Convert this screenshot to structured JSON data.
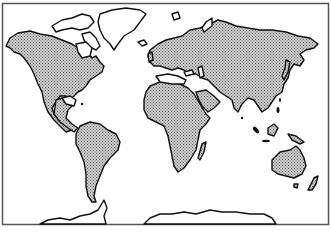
{
  "map": {
    "type": "world-outline-map",
    "projection": "miller-like cylindrical",
    "style": {
      "land_fill": "stippled-gray",
      "land_base_color": "#c8c8c8",
      "dot_color": "#6a6a6a",
      "coastline_color": "#111111",
      "ocean_color": "#ffffff",
      "frame_color": "#555555"
    },
    "regions": [
      {
        "name": "North America",
        "filled": true
      },
      {
        "name": "Greenland",
        "filled": false
      },
      {
        "name": "Canadian Arctic Archipelago",
        "filled": false
      },
      {
        "name": "South America",
        "filled": true
      },
      {
        "name": "Europe",
        "filled": true
      },
      {
        "name": "Asia",
        "filled": true
      },
      {
        "name": "Africa",
        "filled": true
      },
      {
        "name": "Madagascar",
        "filled": true
      },
      {
        "name": "Australia",
        "filled": true
      },
      {
        "name": "New Zealand",
        "filled": true
      },
      {
        "name": "Japan",
        "filled": true
      },
      {
        "name": "Indonesia",
        "filled": true
      },
      {
        "name": "New Guinea",
        "filled": true
      },
      {
        "name": "Antarctica",
        "filled": false
      },
      {
        "name": "Iceland",
        "filled": false
      },
      {
        "name": "Svalbard",
        "filled": false
      },
      {
        "name": "Novaya Zemlya",
        "filled": false
      }
    ]
  }
}
